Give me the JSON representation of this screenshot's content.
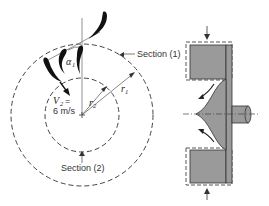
{
  "diagram": {
    "left_view": {
      "labels": {
        "section1": "Section (1)",
        "section2": "Section (2)",
        "velocity_symbol": "V",
        "velocity_sub": "2",
        "velocity_eq": "=",
        "velocity_value": "6 m/s",
        "angle_symbol": "α",
        "angle_sub": "1",
        "r1_symbol": "r",
        "r1_sub": "1",
        "r2_symbol": "r",
        "r2_sub": "2"
      },
      "elements": [
        "outer-dashed-circle-section-1",
        "inner-dashed-circle-section-2",
        "guide-vanes",
        "vertical-reference-line",
        "center-mark"
      ]
    },
    "right_view": {
      "elements": [
        "impeller-cross-section",
        "shaft",
        "flow-arrows",
        "dashed-control-volume",
        "inlet-arrows"
      ]
    },
    "colors": {
      "fill_gray": "#9a9a9a",
      "line": "#333333",
      "vane": "#111111"
    }
  }
}
